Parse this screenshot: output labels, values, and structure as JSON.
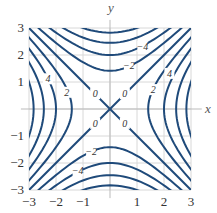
{
  "chart_data": {
    "type": "contour",
    "function": "x^2 - y^2",
    "title": "",
    "xlabel": "x",
    "ylabel": "y",
    "xlim": [
      -3,
      3
    ],
    "ylim": [
      -3,
      3
    ],
    "xticks": [
      "−3",
      "−2",
      "−1",
      "1",
      "2",
      "3"
    ],
    "yticks": [
      "3",
      "2",
      "1",
      "−1",
      "−2",
      "−3"
    ],
    "levels": [
      -8,
      -6,
      -4,
      -2,
      0,
      2,
      4,
      6,
      8
    ],
    "contour_labels": [
      {
        "text": "0",
        "x": 0.55,
        "y": 0.55
      },
      {
        "text": "0",
        "x": -0.55,
        "y": 0.55
      },
      {
        "text": "0",
        "x": -0.55,
        "y": -0.55
      },
      {
        "text": "0",
        "x": 0.55,
        "y": -0.55
      },
      {
        "text": "−2",
        "x": 0.7,
        "y": 1.6
      },
      {
        "text": "−4",
        "x": 1.2,
        "y": 2.3
      },
      {
        "text": "2",
        "x": 1.6,
        "y": 0.7
      },
      {
        "text": "4",
        "x": 2.2,
        "y": 1.3
      },
      {
        "text": "4",
        "x": -2.3,
        "y": 1.1
      },
      {
        "text": "2",
        "x": -1.6,
        "y": 0.6
      },
      {
        "text": "−2",
        "x": -0.7,
        "y": -1.6
      },
      {
        "text": "−4",
        "x": -1.2,
        "y": -2.3
      }
    ],
    "grid": true,
    "line_color": "#1f4a7a",
    "grid_color": "#d8d8d8"
  },
  "axes": {
    "x_label": "x",
    "y_label": "y"
  }
}
